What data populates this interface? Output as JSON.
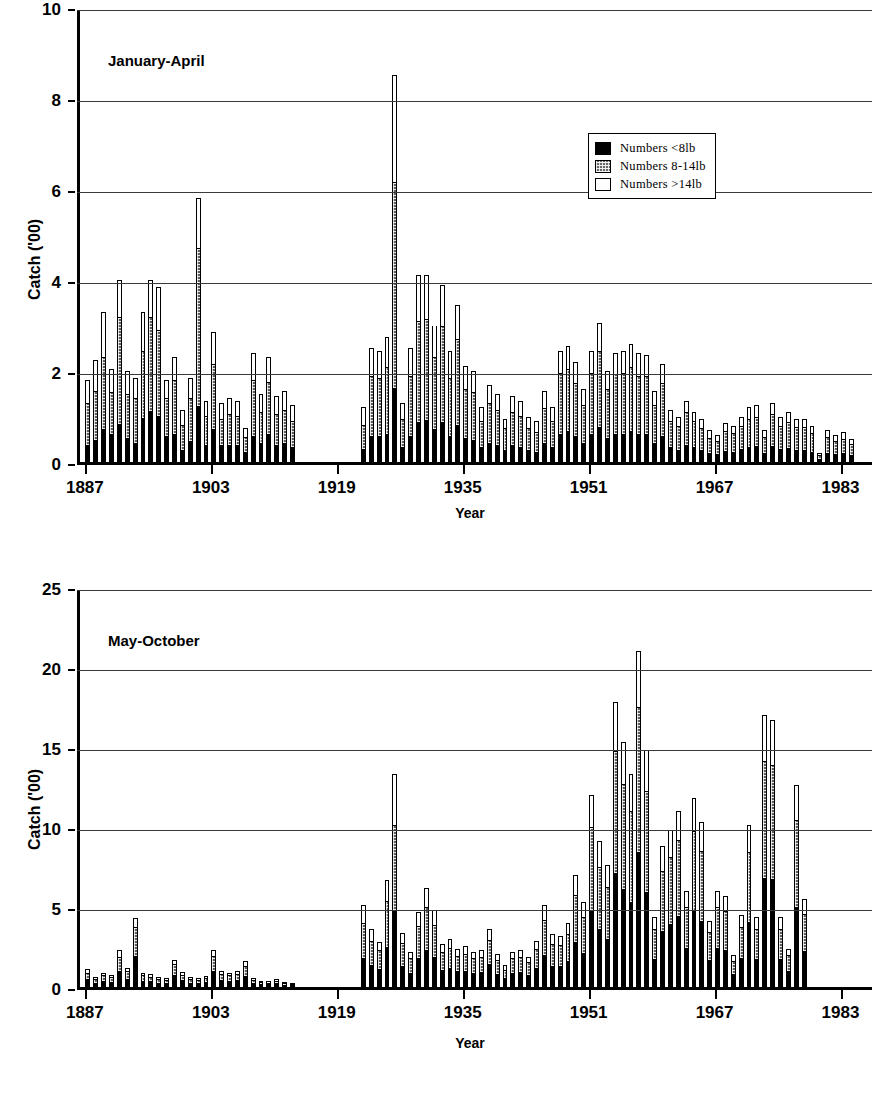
{
  "figure": {
    "background": "#ffffff",
    "ink_color": "#000000"
  },
  "legend": {
    "position": "top-right-of-upper-panel",
    "entries": [
      {
        "key": "small",
        "label": "Numbers <8lb",
        "swatch": "solid-black",
        "color": "#000000"
      },
      {
        "key": "medium",
        "label": "Numbers 8-14lb",
        "swatch": "stippled-grey",
        "color": "#6a6a6a"
      },
      {
        "key": "large",
        "label": "Numbers >14lb",
        "swatch": "open-white",
        "color": "#ffffff"
      }
    ]
  },
  "chart_data": [
    {
      "id": "january-april",
      "type": "bar",
      "stacked": true,
      "title": "January-April",
      "xlabel": "Year",
      "ylabel": "Catch ('00)",
      "xlim": [
        1886,
        1987
      ],
      "ylim": [
        0,
        10
      ],
      "yticks": [
        0,
        2,
        4,
        6,
        8,
        10
      ],
      "xticks": [
        1887,
        1903,
        1919,
        1935,
        1951,
        1967,
        1983
      ],
      "grid": "horizontal",
      "legend_position": "upper-right",
      "series": [
        {
          "name": "Numbers <8lb",
          "key": "small"
        },
        {
          "name": "Numbers 8-14lb",
          "key": "medium"
        },
        {
          "name": "Numbers >14lb",
          "key": "large"
        }
      ],
      "x": [
        1887,
        1888,
        1889,
        1890,
        1891,
        1892,
        1893,
        1894,
        1895,
        1896,
        1897,
        1898,
        1899,
        1900,
        1901,
        1902,
        1903,
        1904,
        1905,
        1906,
        1907,
        1908,
        1909,
        1910,
        1911,
        1912,
        1913,
        1914,
        1915,
        1916,
        1917,
        1918,
        1919,
        1920,
        1921,
        1922,
        1923,
        1924,
        1925,
        1926,
        1927,
        1928,
        1929,
        1930,
        1931,
        1932,
        1933,
        1934,
        1935,
        1936,
        1937,
        1938,
        1939,
        1940,
        1941,
        1942,
        1943,
        1944,
        1945,
        1946,
        1947,
        1948,
        1949,
        1950,
        1951,
        1952,
        1953,
        1954,
        1955,
        1956,
        1957,
        1958,
        1959,
        1960,
        1961,
        1962,
        1963,
        1964,
        1965,
        1966,
        1967,
        1968,
        1969,
        1970,
        1971,
        1972,
        1973,
        1974,
        1975,
        1976,
        1977,
        1978,
        1979,
        1980,
        1981,
        1982,
        1983,
        1984,
        1985,
        1986
      ],
      "totals": [
        1.8,
        2.25,
        3.3,
        2.05,
        4.0,
        2.0,
        1.85,
        3.3,
        4.0,
        3.85,
        1.8,
        2.3,
        1.15,
        1.85,
        5.8,
        1.35,
        2.85,
        1.3,
        1.4,
        1.35,
        0.75,
        2.4,
        1.5,
        2.3,
        1.45,
        1.55,
        1.25,
        0,
        0,
        0,
        0,
        0,
        0,
        0,
        0,
        1.2,
        2.5,
        2.45,
        2.75,
        8.5,
        1.3,
        2.5,
        4.1,
        4.1,
        3.0,
        3.9,
        2.45,
        3.45,
        2.1,
        2.0,
        1.2,
        1.7,
        1.5,
        0.95,
        1.45,
        1.35,
        1.0,
        0.9,
        1.55,
        1.2,
        2.45,
        2.55,
        2.2,
        1.6,
        2.45,
        3.05,
        2.0,
        2.4,
        2.45,
        2.6,
        2.4,
        2.35,
        1.55,
        2.15,
        1.15,
        1.0,
        1.35,
        1.1,
        0.95,
        0.7,
        0.6,
        0.85,
        0.8,
        1.0,
        1.2,
        1.25,
        0.7,
        1.3,
        1.0,
        1.1,
        0.95,
        0.95,
        0.8,
        0.2,
        0.7,
        0.6,
        0.65,
        0.5
      ],
      "segments": {
        "small": [
          0.35,
          0.45,
          0.7,
          0.6,
          0.8,
          0.5,
          0.4,
          0.95,
          1.1,
          1.0,
          0.55,
          0.6,
          0.25,
          0.45,
          1.2,
          0.35,
          0.7,
          0.35,
          0.35,
          0.35,
          0.2,
          0.55,
          0.4,
          0.6,
          0.35,
          0.4,
          0.3,
          0,
          0,
          0,
          0,
          0,
          0,
          0,
          0,
          0.25,
          0.55,
          0.55,
          0.6,
          1.6,
          0.3,
          0.55,
          0.85,
          0.9,
          0.7,
          0.85,
          0.55,
          0.8,
          0.5,
          0.45,
          0.3,
          0.4,
          0.35,
          0.25,
          0.35,
          0.3,
          0.25,
          0.2,
          0.4,
          0.3,
          0.6,
          0.65,
          0.55,
          0.4,
          0.6,
          0.75,
          0.5,
          0.6,
          0.6,
          0.65,
          0.6,
          0.6,
          0.4,
          0.55,
          0.3,
          0.25,
          0.35,
          0.3,
          0.25,
          0.18,
          0.15,
          0.22,
          0.2,
          0.26,
          0.3,
          0.32,
          0.18,
          0.34,
          0.26,
          0.28,
          0.25,
          0.25,
          0.2,
          0.05,
          0.18,
          0.15,
          0.17,
          0.13
        ],
        "medium": [
          0.95,
          1.1,
          1.6,
          0.95,
          2.4,
          1.0,
          1.0,
          1.5,
          2.1,
          1.9,
          0.85,
          1.2,
          0.55,
          0.95,
          3.5,
          0.65,
          1.45,
          0.6,
          0.7,
          0.65,
          0.35,
          1.25,
          0.7,
          1.15,
          0.7,
          0.75,
          0.6,
          0,
          0,
          0,
          0,
          0,
          0,
          0,
          0,
          0.55,
          1.35,
          1.3,
          1.5,
          4.55,
          0.65,
          1.35,
          2.25,
          2.25,
          1.6,
          2.15,
          1.3,
          1.9,
          1.1,
          1.1,
          0.6,
          0.9,
          0.8,
          0.5,
          0.75,
          0.7,
          0.5,
          0.45,
          0.8,
          0.6,
          1.35,
          1.4,
          1.2,
          0.85,
          1.35,
          1.7,
          1.1,
          1.35,
          1.35,
          1.45,
          1.3,
          1.3,
          0.85,
          1.2,
          0.6,
          0.55,
          0.75,
          0.6,
          0.5,
          0.36,
          0.32,
          0.46,
          0.43,
          0.54,
          0.65,
          0.68,
          0.37,
          0.71,
          0.54,
          0.6,
          0.52,
          0.52,
          0.43,
          0.1,
          0.38,
          0.32,
          0.35,
          0.27
        ],
        "large": [
          0.5,
          0.7,
          1.0,
          0.5,
          0.8,
          0.5,
          0.45,
          0.85,
          0.8,
          0.95,
          0.4,
          0.5,
          0.35,
          0.45,
          1.1,
          0.35,
          0.7,
          0.35,
          0.35,
          0.35,
          0.2,
          0.6,
          0.4,
          0.55,
          0.4,
          0.4,
          0.35,
          0,
          0,
          0,
          0,
          0,
          0,
          0,
          0,
          0.4,
          0.6,
          0.6,
          0.65,
          2.35,
          0.35,
          0.6,
          1.0,
          0.95,
          0.7,
          0.9,
          0.6,
          0.75,
          0.5,
          0.45,
          0.3,
          0.4,
          0.35,
          0.2,
          0.35,
          0.35,
          0.25,
          0.25,
          0.35,
          0.3,
          0.5,
          0.5,
          0.45,
          0.35,
          0.5,
          0.6,
          0.4,
          0.45,
          0.5,
          0.5,
          0.5,
          0.45,
          0.3,
          0.4,
          0.25,
          0.2,
          0.25,
          0.2,
          0.2,
          0.16,
          0.13,
          0.17,
          0.17,
          0.2,
          0.25,
          0.25,
          0.15,
          0.25,
          0.2,
          0.22,
          0.18,
          0.18,
          0.17,
          0.05,
          0.14,
          0.13,
          0.13,
          0.1
        ]
      }
    },
    {
      "id": "may-october",
      "type": "bar",
      "stacked": true,
      "title": "May-October",
      "xlabel": "Year",
      "ylabel": "Catch ('00)",
      "xlim": [
        1886,
        1987
      ],
      "ylim": [
        0,
        25
      ],
      "yticks": [
        0,
        5,
        10,
        15,
        20,
        25
      ],
      "xticks": [
        1887,
        1903,
        1919,
        1935,
        1951,
        1967,
        1983
      ],
      "grid": "horizontal",
      "series": [
        {
          "name": "Numbers <8lb",
          "key": "small"
        },
        {
          "name": "Numbers 8-14lb",
          "key": "medium"
        },
        {
          "name": "Numbers >14lb",
          "key": "large"
        }
      ],
      "x": [
        1887,
        1888,
        1889,
        1890,
        1891,
        1892,
        1893,
        1894,
        1895,
        1896,
        1897,
        1898,
        1899,
        1900,
        1901,
        1902,
        1903,
        1904,
        1905,
        1906,
        1907,
        1908,
        1909,
        1910,
        1911,
        1912,
        1913,
        1914,
        1915,
        1916,
        1917,
        1918,
        1919,
        1920,
        1921,
        1922,
        1923,
        1924,
        1925,
        1926,
        1927,
        1928,
        1929,
        1930,
        1931,
        1932,
        1933,
        1934,
        1935,
        1936,
        1937,
        1938,
        1939,
        1940,
        1941,
        1942,
        1943,
        1944,
        1945,
        1946,
        1947,
        1948,
        1949,
        1950,
        1951,
        1952,
        1953,
        1954,
        1955,
        1956,
        1957,
        1958,
        1959,
        1960,
        1961,
        1962,
        1963,
        1964,
        1965,
        1966,
        1967,
        1968,
        1969,
        1970,
        1971,
        1972,
        1973,
        1974,
        1975,
        1976,
        1977,
        1978,
        1979,
        1980,
        1981,
        1982,
        1983,
        1984,
        1985,
        1986
      ],
      "totals": [
        1.1,
        0.6,
        0.9,
        0.75,
        2.3,
        1.2,
        4.3,
        0.9,
        0.8,
        0.6,
        0.55,
        1.7,
        0.95,
        0.6,
        0.55,
        0.7,
        2.3,
        1.0,
        0.9,
        1.0,
        1.6,
        0.55,
        0.4,
        0.35,
        0.5,
        0.3,
        0.25,
        0,
        0,
        0,
        0,
        0,
        0,
        0,
        0,
        5.1,
        3.6,
        2.8,
        6.7,
        13.3,
        3.4,
        2.2,
        4.7,
        6.2,
        4.8,
        2.7,
        3.0,
        2.4,
        2.55,
        2.2,
        2.3,
        3.6,
        2.05,
        1.35,
        2.2,
        2.3,
        1.9,
        2.9,
        5.1,
        3.3,
        3.2,
        4.0,
        7.0,
        5.3,
        12.0,
        9.1,
        7.6,
        17.8,
        15.3,
        13.3,
        21.0,
        14.8,
        4.4,
        8.8,
        9.8,
        11.0,
        6.0,
        11.8,
        10.3,
        4.1,
        6.0,
        5.7,
        2.0,
        4.5,
        10.1,
        4.4,
        17.0,
        16.7,
        4.4,
        2.4,
        12.6,
        5.5
      ],
      "segments": {
        "small": [
          0.45,
          0.25,
          0.38,
          0.3,
          0.95,
          0.5,
          1.9,
          0.38,
          0.34,
          0.25,
          0.23,
          0.72,
          0.4,
          0.25,
          0.23,
          0.3,
          0.98,
          0.42,
          0.38,
          0.42,
          0.68,
          0.24,
          0.17,
          0.15,
          0.22,
          0.13,
          0.11,
          0,
          0,
          0,
          0,
          0,
          0,
          0,
          0,
          1.8,
          1.35,
          1.1,
          2.5,
          4.8,
          1.3,
          0.85,
          1.8,
          2.3,
          1.85,
          1.05,
          1.15,
          0.95,
          1.0,
          0.86,
          0.9,
          1.4,
          0.8,
          0.53,
          0.86,
          0.9,
          0.75,
          1.15,
          2.0,
          1.3,
          1.26,
          1.6,
          2.8,
          2.1,
          4.8,
          3.6,
          3.0,
          7.1,
          6.1,
          5.3,
          8.4,
          5.9,
          1.75,
          3.5,
          3.9,
          4.4,
          2.4,
          4.7,
          4.1,
          1.65,
          2.4,
          2.3,
          0.8,
          1.8,
          4.05,
          1.75,
          6.8,
          6.7,
          1.75,
          0.95,
          5.0,
          2.2
        ],
        "medium": [
          0.45,
          0.25,
          0.37,
          0.32,
          0.95,
          0.5,
          1.85,
          0.37,
          0.32,
          0.25,
          0.22,
          0.72,
          0.4,
          0.25,
          0.22,
          0.28,
          0.95,
          0.4,
          0.36,
          0.4,
          0.68,
          0.22,
          0.16,
          0.14,
          0.2,
          0.12,
          0.1,
          0,
          0,
          0,
          0,
          0,
          0,
          0,
          0,
          2.2,
          1.55,
          1.2,
          2.9,
          5.3,
          1.45,
          0.95,
          2.0,
          2.7,
          2.05,
          1.15,
          1.3,
          1.0,
          1.1,
          0.94,
          0.98,
          1.55,
          0.88,
          0.57,
          0.94,
          0.98,
          0.82,
          1.25,
          2.2,
          1.42,
          1.38,
          1.72,
          3.0,
          2.3,
          5.2,
          3.9,
          3.3,
          7.7,
          6.6,
          5.75,
          9.1,
          6.4,
          1.9,
          3.8,
          4.25,
          4.78,
          2.6,
          5.1,
          4.45,
          1.78,
          2.6,
          2.48,
          0.87,
          1.95,
          4.38,
          1.9,
          7.35,
          7.2,
          1.9,
          1.05,
          5.45,
          2.4
        ],
        "large": [
          0.2,
          0.1,
          0.15,
          0.13,
          0.4,
          0.2,
          0.55,
          0.15,
          0.14,
          0.1,
          0.1,
          0.26,
          0.15,
          0.1,
          0.1,
          0.12,
          0.37,
          0.18,
          0.16,
          0.18,
          0.24,
          0.09,
          0.07,
          0.06,
          0.08,
          0.05,
          0.04,
          0,
          0,
          0,
          0,
          0,
          0,
          0,
          0,
          1.1,
          0.7,
          0.5,
          1.3,
          3.2,
          0.65,
          0.4,
          0.9,
          1.2,
          0.9,
          0.5,
          0.55,
          0.45,
          0.45,
          0.4,
          0.42,
          0.65,
          0.37,
          0.25,
          0.4,
          0.42,
          0.33,
          0.5,
          0.9,
          0.58,
          0.56,
          0.68,
          1.2,
          0.9,
          2.0,
          1.6,
          1.3,
          3.0,
          2.6,
          2.25,
          3.5,
          2.5,
          0.75,
          1.5,
          1.65,
          1.82,
          1.0,
          2.0,
          1.75,
          0.67,
          1.0,
          0.92,
          0.33,
          0.75,
          1.67,
          0.75,
          2.85,
          2.8,
          0.75,
          0.4,
          2.15,
          0.9
        ]
      }
    }
  ]
}
